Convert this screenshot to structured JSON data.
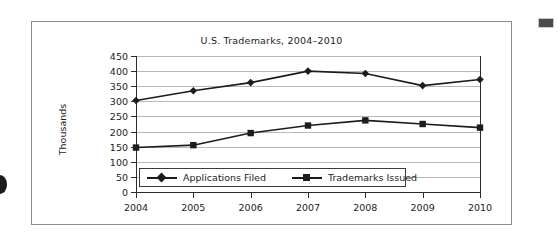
{
  "figure": {
    "title": "U.S. Trademarks, 2004–2010",
    "frame_color": "#8d8d8d",
    "background": "#ffffff"
  },
  "marks": {
    "left_bullet": "bullet-mark",
    "right_swatch": "swatch-mark",
    "right_swatch_color": "#4b4b4b"
  },
  "chart_data": {
    "type": "line",
    "title": "U.S. Trademarks, 2004–2010",
    "xlabel": "",
    "ylabel": "Thousands",
    "categories": [
      "2004",
      "2005",
      "2006",
      "2007",
      "2008",
      "2009",
      "2010"
    ],
    "x": [
      2004,
      2005,
      2006,
      2007,
      2008,
      2009,
      2010
    ],
    "ylim": [
      0,
      450
    ],
    "ytick_step": 50,
    "yticks": [
      0,
      50,
      100,
      150,
      200,
      250,
      300,
      350,
      400,
      450
    ],
    "ytick_labels": [
      "450",
      "400",
      "350",
      "300",
      "250",
      "200",
      "150",
      "100",
      "50",
      "0"
    ],
    "grid": true,
    "grid_axis": "y",
    "legend_position": "lower-left-inside",
    "series": [
      {
        "name": "Applications Filed",
        "marker": "diamond",
        "color": "#1c1c1c",
        "values": [
          303,
          335,
          362,
          400,
          392,
          352,
          372
        ]
      },
      {
        "name": "Trademarks Issued",
        "marker": "square",
        "color": "#1c1c1c",
        "values": [
          147,
          155,
          195,
          220,
          237,
          225,
          213
        ]
      }
    ]
  }
}
